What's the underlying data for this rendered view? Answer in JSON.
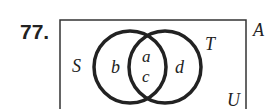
{
  "problem_number": "77.",
  "diagram": {
    "type": "venn",
    "universe_label": "U",
    "outside_label": "A",
    "sets": [
      {
        "name": "S",
        "label": "S"
      },
      {
        "name": "T",
        "label": "T"
      }
    ],
    "regions": {
      "s_only": "b",
      "intersection_top": "a",
      "intersection_bottom": "c",
      "t_only": "d"
    }
  }
}
